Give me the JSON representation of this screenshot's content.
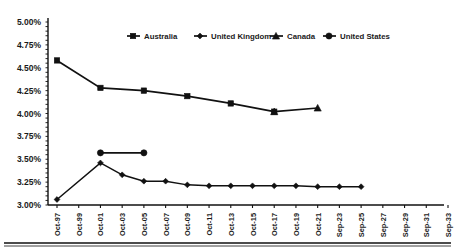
{
  "chart_data": {
    "type": "line",
    "title": "",
    "xlabel": "",
    "ylabel": "",
    "ylim": [
      3.0,
      5.0
    ],
    "ytick_step": 0.25,
    "grid": false,
    "legend_position": "top-center",
    "ytick_labels": [
      "5.00%",
      "4.75%",
      "4.50%",
      "4.25%",
      "4.00%",
      "3.75%",
      "3.50%",
      "3.25%",
      "3.00%"
    ],
    "ytick_values": [
      5.0,
      4.75,
      4.5,
      4.25,
      4.0,
      3.75,
      3.5,
      3.25,
      3.0
    ],
    "categories": [
      "Oct-97",
      "Oct-99",
      "Oct-01",
      "Oct-03",
      "Oct-05",
      "Oct-07",
      "Oct-09",
      "Oct-11",
      "Oct-13",
      "Oct-15",
      "Oct-17",
      "Oct-19",
      "Oct-21",
      "Sep-23",
      "Sep-25",
      "Sep-27",
      "Sep-29",
      "Sep-31",
      "Sep-33"
    ],
    "series": [
      {
        "name": "Australia",
        "marker": "square",
        "x": [
          "Oct-97",
          "Oct-01",
          "Oct-05",
          "Oct-09",
          "Oct-13",
          "Oct-17"
        ],
        "values": [
          4.58,
          4.28,
          4.25,
          4.19,
          4.11,
          4.02
        ]
      },
      {
        "name": "United Kingdom",
        "marker": "diamond",
        "x": [
          "Oct-97",
          "Oct-01",
          "Oct-03",
          "Oct-05",
          "Oct-07",
          "Oct-09",
          "Oct-11",
          "Oct-13",
          "Oct-15",
          "Oct-17",
          "Oct-19",
          "Oct-21",
          "Sep-23",
          "Sep-25"
        ],
        "values": [
          3.06,
          3.46,
          3.33,
          3.26,
          3.26,
          3.22,
          3.21,
          3.21,
          3.21,
          3.21,
          3.21,
          3.2,
          3.2,
          3.2
        ]
      },
      {
        "name": "Canada",
        "marker": "triangle",
        "x": [
          "Oct-17",
          "Oct-21"
        ],
        "values": [
          4.02,
          4.06
        ]
      },
      {
        "name": "United States",
        "marker": "circle",
        "x": [
          "Oct-01",
          "Oct-05"
        ],
        "values": [
          3.57,
          3.57
        ]
      }
    ]
  },
  "legend": {
    "items": [
      {
        "label": "Australia",
        "marker": "square"
      },
      {
        "label": "United Kingdom",
        "marker": "diamond"
      },
      {
        "label": "Canada",
        "marker": "triangle"
      },
      {
        "label": "United States",
        "marker": "circle"
      }
    ]
  }
}
